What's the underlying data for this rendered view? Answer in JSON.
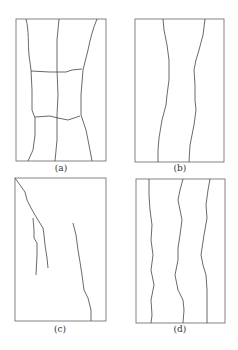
{
  "figure": {
    "panels": [
      {
        "id": "a",
        "caption": "(a)",
        "description": "rectangle with two vertical cracks and two horizontal cracks forming a grid in the middle"
      },
      {
        "id": "b",
        "caption": "(b)",
        "description": "rectangle with two wavy vertical cracks"
      },
      {
        "id": "c",
        "caption": "(c)",
        "description": "rectangle with diagonal cracks from top-left and a crack on the right"
      },
      {
        "id": "d",
        "caption": "(d)",
        "description": "rectangle with three wavy vertical cracks"
      }
    ],
    "stroke_color": "#444444",
    "border_color": "#777777"
  }
}
